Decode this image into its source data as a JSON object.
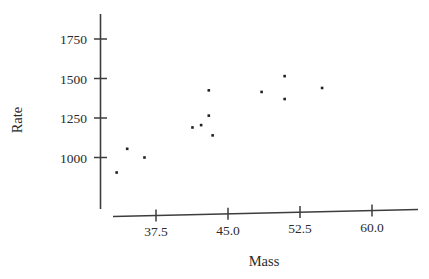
{
  "chart_data": {
    "type": "scatter",
    "title": "",
    "subtitle": "",
    "xlabel": "Mass",
    "ylabel": "Rate",
    "xlim": [
      32.0,
      63.5
    ],
    "ylim": [
      860,
      1820
    ],
    "grid": false,
    "legend": null,
    "xticks": [
      37.5,
      45.0,
      52.5,
      60.0
    ],
    "xticklabels": [
      "37.5",
      "45.0",
      "52.5",
      "60.0"
    ],
    "yticks": [
      1000,
      1250,
      1500,
      1750
    ],
    "yticklabels": [
      "1000",
      "1250",
      "1500",
      "1750"
    ],
    "marker": "square",
    "marker_color": "#222222",
    "marker_size": 2.6,
    "points": [
      {
        "x": 33.4,
        "y": 905
      },
      {
        "x": 34.5,
        "y": 1055
      },
      {
        "x": 36.3,
        "y": 1000
      },
      {
        "x": 41.3,
        "y": 1190
      },
      {
        "x": 42.2,
        "y": 1205
      },
      {
        "x": 43.0,
        "y": 1425
      },
      {
        "x": 43.0,
        "y": 1265
      },
      {
        "x": 43.4,
        "y": 1140
      },
      {
        "x": 48.5,
        "y": 1415
      },
      {
        "x": 50.9,
        "y": 1515
      },
      {
        "x": 50.9,
        "y": 1370
      },
      {
        "x": 54.8,
        "y": 1440
      }
    ]
  },
  "axes": {
    "y_axis_name": "rate-axis",
    "x_axis_name": "mass-axis"
  }
}
